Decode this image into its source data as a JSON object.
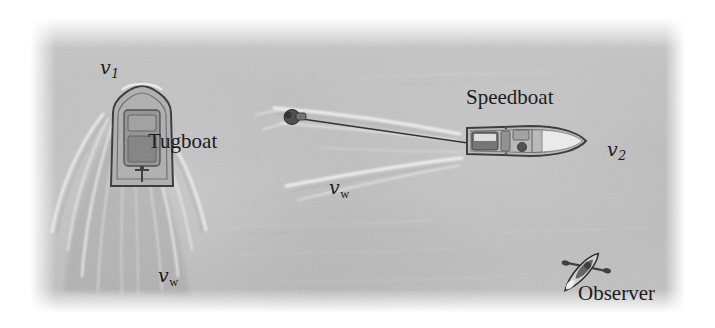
{
  "figure": {
    "width": 715,
    "height": 328,
    "background_color": "#ffffff",
    "water_color": "#b9b9b9",
    "ink_color": "#1c1c1c"
  },
  "labels": {
    "v1": {
      "symbol": "v",
      "subscript": "1",
      "x": 100,
      "y": 58
    },
    "tugboat": {
      "text": "Tugboat",
      "x": 148,
      "y": 131
    },
    "vw_left": {
      "symbol": "v",
      "subscript": "w",
      "x": 158,
      "y": 266
    },
    "vw_middle": {
      "symbol": "v",
      "subscript": "w",
      "x": 329,
      "y": 178
    },
    "speedboat": {
      "text": "Speedboat",
      "x": 466,
      "y": 87
    },
    "v2": {
      "symbol": "v",
      "subscript": "2",
      "x": 607,
      "y": 140
    },
    "observer": {
      "text": "Observer",
      "x": 578,
      "y": 283
    }
  },
  "objects": {
    "tugboat": {
      "name": "Tugboat",
      "heading": "up",
      "x": 113,
      "y": 155
    },
    "speedboat": {
      "name": "Speedboat",
      "heading": "right",
      "x": 505,
      "y": 140
    },
    "towed_object": {
      "name": "water-skier",
      "x": 298,
      "y": 117
    },
    "tow_rope": {
      "from_x": 302,
      "from_y": 119,
      "to_x": 466,
      "to_y": 143
    },
    "kayak": {
      "name": "Observer kayak",
      "x": 597,
      "y": 255,
      "rotation_deg": 42
    }
  }
}
